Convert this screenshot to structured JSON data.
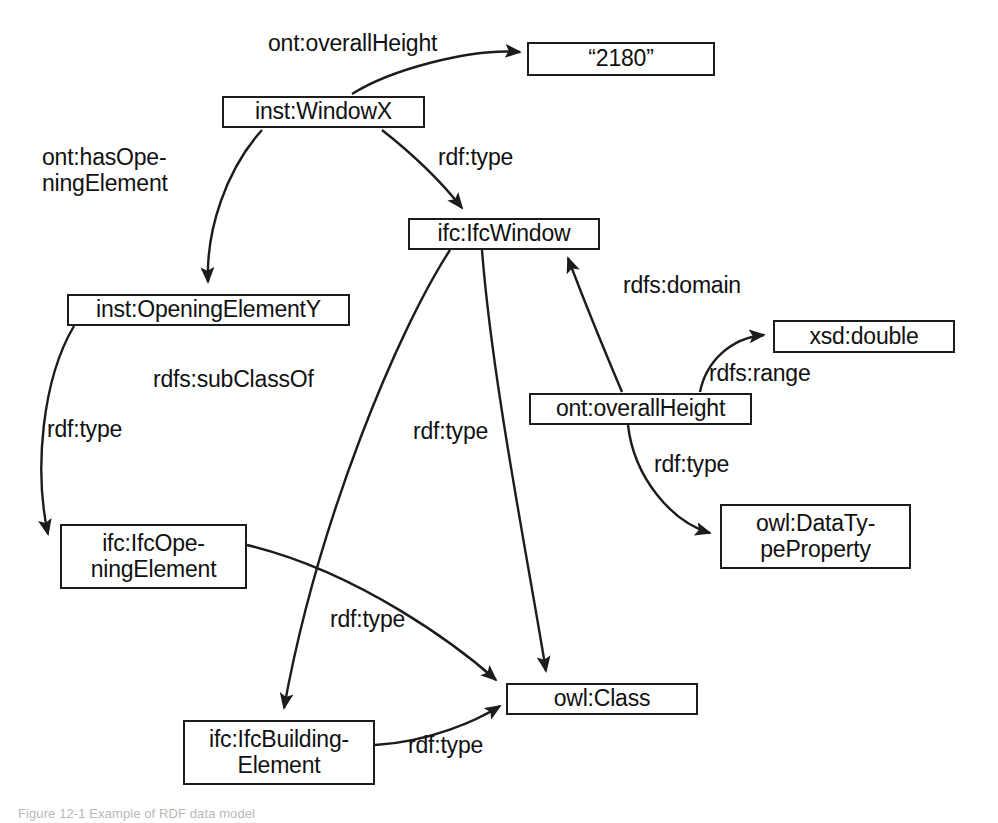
{
  "figure": {
    "kind": "rdf-graph",
    "caption": "Figure 12-1  Example of RDF data model",
    "background_color": "#ffffff",
    "stroke_color": "#1c1c1c",
    "text_color": "#111111"
  },
  "nodes": [
    {
      "id": "instWindowX",
      "label": "inst:WindowX",
      "x": 222,
      "y": 96,
      "w": 203,
      "h": 32
    },
    {
      "id": "literal2180",
      "label": "“2180”",
      "x": 527,
      "y": 42,
      "w": 188,
      "h": 34
    },
    {
      "id": "instOpeningElementY",
      "label": "inst:OpeningElementY",
      "x": 67,
      "y": 294,
      "w": 283,
      "h": 32
    },
    {
      "id": "ifcIfcWindow",
      "label": "ifc:IfcWindow",
      "x": 408,
      "y": 218,
      "w": 192,
      "h": 32
    },
    {
      "id": "xsdDouble",
      "label": "xsd:double",
      "x": 773,
      "y": 320,
      "w": 182,
      "h": 33
    },
    {
      "id": "ontOverallHeight",
      "label": "ont:overallHeight",
      "x": 529,
      "y": 393,
      "w": 223,
      "h": 32
    },
    {
      "id": "owlDataTypeProperty",
      "label": "owl:DataTy-\npeProperty",
      "x": 720,
      "y": 504,
      "w": 191,
      "h": 65
    },
    {
      "id": "ifcIfcOpeningElement",
      "label": "ifc:IfcOpe-\nningElement",
      "x": 60,
      "y": 524,
      "w": 187,
      "h": 65
    },
    {
      "id": "owlClass",
      "label": "owl:Class",
      "x": 506,
      "y": 683,
      "w": 192,
      "h": 32
    },
    {
      "id": "ifcIfcBuildingElement",
      "label": "ifc:IfcBuilding-\nElement",
      "x": 183,
      "y": 720,
      "w": 192,
      "h": 65
    }
  ],
  "edges": [
    {
      "id": "e-overallHeight-literal",
      "predicate": "ont:overallHeight",
      "from": "instWindowX",
      "to": "literal2180",
      "path": "M 352 94 C 390 70 470 48 520 52",
      "label_x": 268,
      "label_y": 31
    },
    {
      "id": "e-windowX-type",
      "predicate": "rdf:type",
      "from": "instWindowX",
      "to": "ifcIfcWindow",
      "path": "M 382 130 C 410 152 440 180 462 208",
      "label_x": 438,
      "label_y": 145
    },
    {
      "id": "e-hasOpeningElement",
      "predicate": "ont:hasOpe-\nningElement",
      "from": "instWindowX",
      "to": "instOpeningElementY",
      "path": "M 262 130 C 226 170 206 230 208 282",
      "label_x": 42,
      "label_y": 145
    },
    {
      "id": "e-openingY-type",
      "predicate": "rdf:type",
      "from": "instOpeningElementY",
      "to": "ifcIfcOpeningElement",
      "path": "M 74 326 C 42 380 34 470 48 534",
      "label_x": 47,
      "label_y": 417
    },
    {
      "id": "e-window-subclassof",
      "predicate": "rdfs:subClassOf",
      "from": "ifcIfcWindow",
      "to": "ifcIfcBuildingElement",
      "path": "M 450 250 C 398 330 318 520 284 708",
      "label_x": 153,
      "label_y": 367
    },
    {
      "id": "e-window-type-class",
      "predicate": "rdf:type",
      "from": "ifcIfcWindow",
      "to": "owlClass",
      "path": "M 482 250 C 492 380 528 560 546 671",
      "label_x": 413,
      "label_y": 419
    },
    {
      "id": "e-domain",
      "predicate": "rdfs:domain",
      "from": "ontOverallHeight",
      "to": "ifcIfcWindow",
      "path": "M 622 392 C 600 340 580 290 568 258",
      "label_x": 623,
      "label_y": 273
    },
    {
      "id": "e-range",
      "predicate": "rdfs:range",
      "from": "ontOverallHeight",
      "to": "xsdDouble",
      "path": "M 700 392 C 706 362 730 338 764 335",
      "label_x": 709,
      "label_y": 361
    },
    {
      "id": "e-prop-type",
      "predicate": "rdf:type",
      "from": "ontOverallHeight",
      "to": "owlDataTypeProperty",
      "path": "M 628 425 C 634 478 672 522 710 533",
      "label_x": 654,
      "label_y": 452
    },
    {
      "id": "e-opening-type-class",
      "predicate": "rdf:type",
      "from": "ifcIfcOpeningElement",
      "to": "owlClass",
      "path": "M 247 545 C 360 572 460 648 496 680",
      "label_x": 330,
      "label_y": 607
    },
    {
      "id": "e-buildingelement-type-class",
      "predicate": "rdf:type",
      "from": "ifcIfcBuildingElement",
      "to": "owlClass",
      "path": "M 375 745 C 430 742 478 720 500 706",
      "label_x": 408,
      "label_y": 733
    }
  ]
}
